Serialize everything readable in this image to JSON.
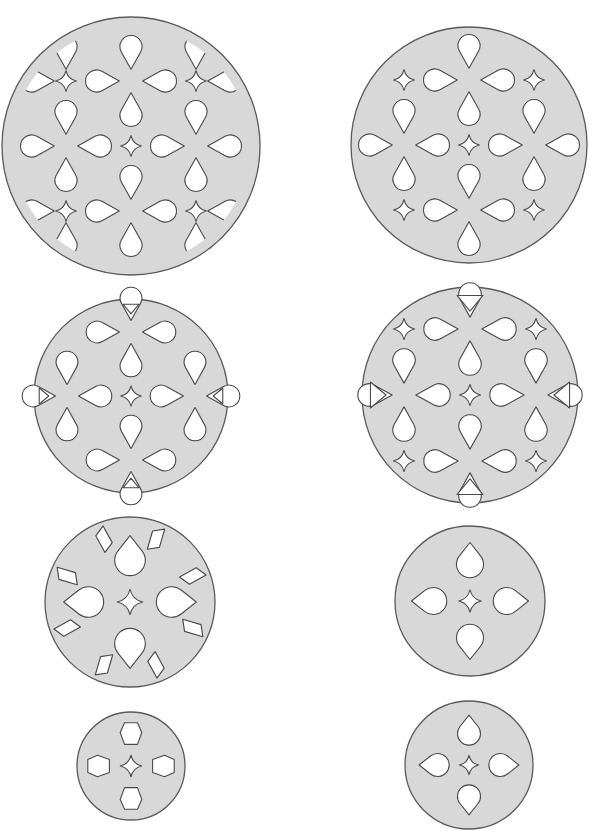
{
  "colors": {
    "disc_fill": "#d8d8d8",
    "disc_stroke": "#5a5a5a",
    "hole_fill": "#ffffff",
    "hole_stroke": "#4a4a4a",
    "background": "#ffffff"
  },
  "discs": [
    {
      "id": "disc-1",
      "cx": 131,
      "cy": 146,
      "r": 129,
      "pattern": "flower-grid",
      "spacing": 65,
      "corner_stars": true,
      "center_star": true,
      "rim_shapes": "clipped-drops",
      "rim_triangles": false
    },
    {
      "id": "disc-2",
      "cx": 469,
      "cy": 145,
      "r": 118,
      "pattern": "flower-grid",
      "spacing": 65,
      "corner_stars": true,
      "center_star": true,
      "rim_shapes": "none",
      "rim_triangles": false
    },
    {
      "id": "disc-3",
      "cx": 131,
      "cy": 396,
      "r": 97,
      "pattern": "flower-grid",
      "spacing": 64,
      "corner_stars": false,
      "center_star": true,
      "rim_shapes": "none",
      "rim_triangles": true,
      "triangle_size": 8
    },
    {
      "id": "disc-4",
      "cx": 470,
      "cy": 395,
      "r": 108,
      "pattern": "flower-grid",
      "spacing": 66,
      "corner_stars": true,
      "center_star": true,
      "rim_shapes": "none",
      "rim_triangles": true,
      "triangle_size": 13
    },
    {
      "id": "disc-5",
      "cx": 130,
      "cy": 602,
      "r": 85,
      "pattern": "cross-drops",
      "drop_offset": 8,
      "center_star": true,
      "rim_shapes": "slots"
    },
    {
      "id": "disc-6",
      "cx": 470,
      "cy": 601,
      "r": 75,
      "pattern": "cross-drops",
      "drop_offset": 8,
      "center_star": true,
      "rim_shapes": "none"
    },
    {
      "id": "disc-7",
      "cx": 131,
      "cy": 766,
      "r": 54,
      "pattern": "cross-hexagons",
      "center_star": true,
      "rim_shapes": "none"
    },
    {
      "id": "disc-8",
      "cx": 469,
      "cy": 765,
      "r": 64,
      "pattern": "cross-drops",
      "drop_offset": 8,
      "center_star": true,
      "rim_shapes": "none"
    }
  ]
}
